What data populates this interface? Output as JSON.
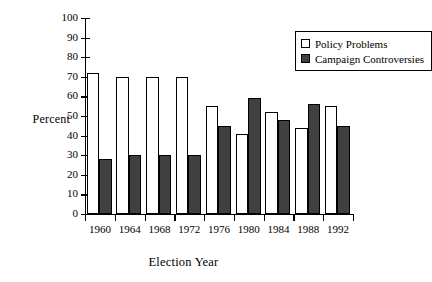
{
  "chart_data": {
    "type": "bar",
    "title": "",
    "xlabel": "Election Year",
    "ylabel": "Percent",
    "categories": [
      "1960",
      "1964",
      "1968",
      "1972",
      "1976",
      "1980",
      "1984",
      "1988",
      "1992"
    ],
    "series": [
      {
        "name": "Policy Problems",
        "color": "#ffffff",
        "values": [
          72,
          70,
          70,
          70,
          55,
          41,
          52,
          44,
          55
        ]
      },
      {
        "name": "Campaign Controversies",
        "color": "#404040",
        "values": [
          28,
          30,
          30,
          30,
          45,
          59,
          48,
          56,
          45
        ]
      }
    ],
    "ylim": [
      0,
      100
    ],
    "yticks": [
      0,
      10,
      20,
      30,
      40,
      50,
      60,
      70,
      80,
      90,
      100
    ],
    "ytick_labels": [
      "0",
      "10",
      "20",
      "30",
      "40",
      "50",
      "60",
      "70",
      "80",
      "90",
      "100"
    ],
    "grid": false,
    "legend_position": "top-right",
    "frame": "left-bottom-only"
  },
  "legend": {
    "items": [
      {
        "label": "Policy Problems",
        "swatch": "policy"
      },
      {
        "label": "Campaign Controversies",
        "swatch": "campaign"
      }
    ]
  }
}
